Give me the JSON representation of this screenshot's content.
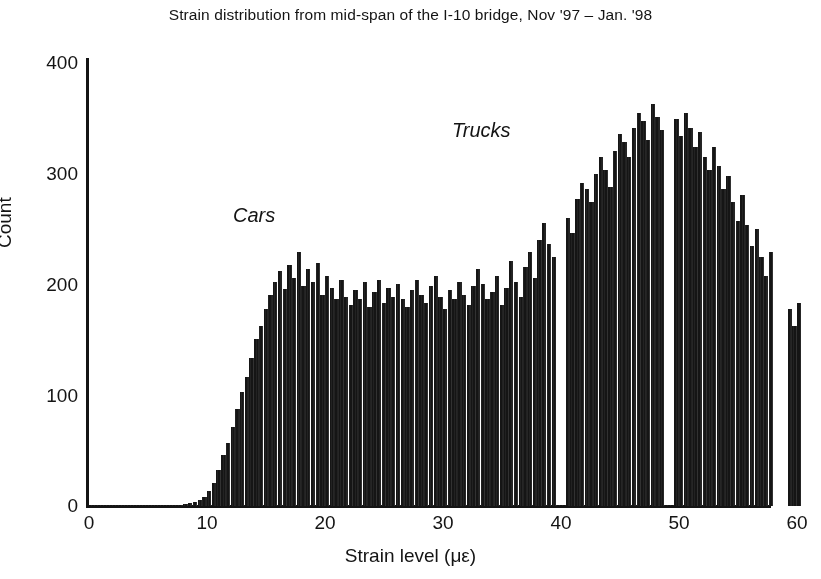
{
  "chart_data": {
    "type": "bar",
    "title": "Strain distribution from mid-span of the I-10 bridge, Nov '97 – Jan. '98",
    "xlabel": "Strain level (με)",
    "ylabel": "Count",
    "xlim": [
      0,
      60
    ],
    "ylim": [
      0,
      420
    ],
    "xticks": [
      0,
      10,
      20,
      30,
      40,
      50,
      60
    ],
    "yticks": [
      0,
      100,
      200,
      300,
      400
    ],
    "grid": false,
    "legend": null,
    "bar_color": "#151515",
    "background_color": "#ffffff",
    "bin_width": 0.4,
    "annotations": [
      {
        "text": "Cars",
        "x": 14.0,
        "y": 272,
        "style": "italic"
      },
      {
        "text": "Trucks",
        "x": 32.8,
        "y": 348,
        "style": "italic"
      }
    ],
    "x_start": 6.8,
    "values": [
      0,
      0,
      1,
      2,
      3,
      4,
      6,
      9,
      14,
      22,
      34,
      48,
      60,
      75,
      92,
      108,
      122,
      140,
      158,
      170,
      186,
      200,
      212,
      222,
      205,
      228,
      216,
      240,
      208,
      224,
      212,
      230,
      200,
      218,
      206,
      196,
      214,
      198,
      190,
      204,
      196,
      212,
      188,
      202,
      214,
      192,
      206,
      198,
      210,
      196,
      188,
      204,
      214,
      200,
      192,
      208,
      218,
      198,
      186,
      204,
      196,
      212,
      200,
      190,
      208,
      224,
      210,
      196,
      202,
      218,
      190,
      206,
      232,
      212,
      198,
      226,
      240,
      216,
      252,
      268,
      248,
      236,
      262,
      280,
      272,
      258,
      290,
      306,
      300,
      288,
      314,
      330,
      318,
      302,
      336,
      352,
      344,
      330,
      358,
      372,
      364,
      346,
      380,
      368,
      356,
      376,
      402,
      366,
      350,
      372,
      358,
      340,
      354,
      330,
      318,
      340,
      322,
      300,
      312,
      288,
      270,
      294,
      266,
      246,
      262,
      236,
      218,
      240,
      212,
      196,
      224,
      186,
      170,
      192,
      160,
      146,
      168,
      142,
      126,
      150,
      248,
      132,
      118,
      138,
      112,
      96,
      120,
      100,
      84,
      106,
      88,
      72,
      94,
      76,
      62,
      82,
      66,
      54,
      70,
      58,
      46,
      62,
      50,
      40,
      54,
      44,
      34,
      48,
      38,
      30,
      42,
      34,
      26,
      36,
      46,
      28,
      22,
      34,
      26,
      20,
      30,
      24,
      18,
      26,
      20,
      15,
      22,
      17,
      13,
      19,
      15,
      11,
      17,
      24,
      12,
      9,
      14,
      11,
      8,
      12,
      10,
      7,
      11,
      8,
      6,
      9,
      7,
      5,
      8,
      6,
      5,
      7,
      6,
      4,
      6,
      5,
      4,
      6,
      5,
      4,
      5,
      4,
      3,
      5,
      4,
      3,
      4,
      3,
      3,
      4,
      3,
      3,
      3,
      2,
      3,
      3,
      2,
      3,
      2,
      2,
      3,
      2,
      2,
      2,
      2,
      2,
      2,
      1,
      2,
      2,
      1,
      2,
      1,
      1,
      2,
      1
    ],
    "empty_bins": [
      82,
      83,
      105,
      106,
      128,
      129,
      130,
      148,
      149,
      150
    ]
  },
  "axis": {
    "y_ticks": [
      "0",
      "100",
      "200",
      "300",
      "400"
    ],
    "x_ticks": [
      "0",
      "10",
      "20",
      "30",
      "40",
      "50",
      "60"
    ],
    "y_title": "Count",
    "x_title": "Strain level (με)"
  },
  "annotations": {
    "cars": "Cars",
    "trucks": "Trucks"
  },
  "title": "Strain distribution from mid-span of the I-10 bridge, Nov '97 – Jan. '98"
}
